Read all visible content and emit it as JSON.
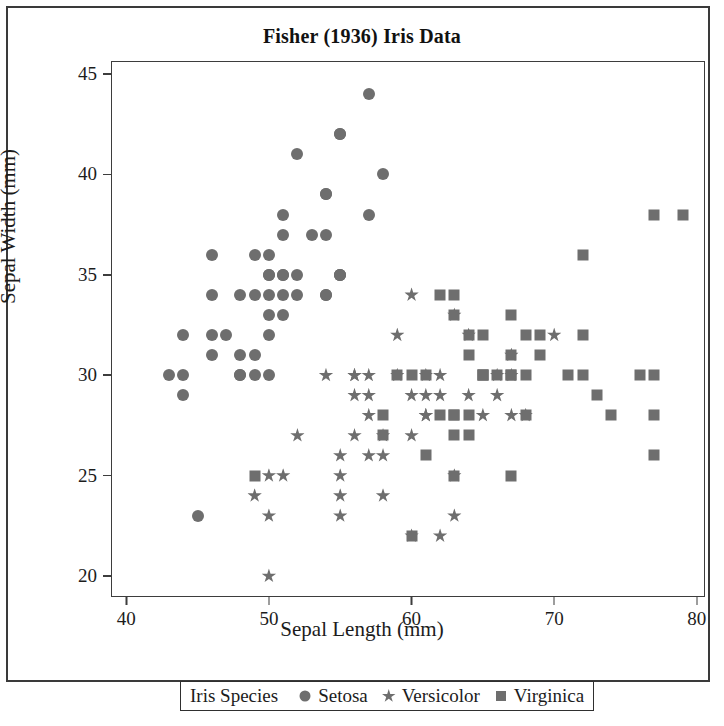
{
  "figure": {
    "title": "Fisher (1936) Iris Data"
  },
  "axes": {
    "x_title": "Sepal Length (mm)",
    "y_title": "Sepal Width (mm)"
  },
  "legend": {
    "title": "Iris Species",
    "entries": [
      {
        "label": "Setosa",
        "marker": "circle-marker-icon"
      },
      {
        "label": "Versicolor",
        "marker": "star-marker-icon"
      },
      {
        "label": "Virginica",
        "marker": "square-marker-icon"
      }
    ]
  },
  "colors": {
    "marker": "#6e6e6e",
    "axis": "#3d3d3d",
    "text": "#1c1c1c",
    "background": "#ffffff",
    "page_border": "#3a3a3a"
  },
  "chart_data": {
    "type": "scatter",
    "title": "Fisher (1936) Iris Data",
    "xlabel": "Sepal Length (mm)",
    "ylabel": "Sepal Width (mm)",
    "xlim": [
      39,
      80.5
    ],
    "ylim": [
      19,
      45.6
    ],
    "xticks": [
      40,
      50,
      60,
      70,
      80
    ],
    "yticks": [
      20,
      25,
      30,
      35,
      40,
      45
    ],
    "grid": false,
    "legend_position": "below-axes",
    "series": [
      {
        "name": "Setosa",
        "marker": "circle",
        "color": "#6e6e6e",
        "points": [
          [
            43,
            30
          ],
          [
            44,
            30
          ],
          [
            44,
            32
          ],
          [
            44,
            29
          ],
          [
            45,
            23
          ],
          [
            46,
            36
          ],
          [
            46,
            34
          ],
          [
            46,
            31
          ],
          [
            46,
            32
          ],
          [
            47,
            32
          ],
          [
            48,
            34
          ],
          [
            48,
            31
          ],
          [
            48,
            30
          ],
          [
            48,
            30
          ],
          [
            49,
            31
          ],
          [
            49,
            36
          ],
          [
            49,
            30
          ],
          [
            49,
            34
          ],
          [
            50,
            36
          ],
          [
            50,
            35
          ],
          [
            50,
            34
          ],
          [
            50,
            33
          ],
          [
            50,
            30
          ],
          [
            50,
            35
          ],
          [
            50,
            32
          ],
          [
            51,
            35
          ],
          [
            51,
            38
          ],
          [
            51,
            37
          ],
          [
            51,
            33
          ],
          [
            51,
            34
          ],
          [
            51,
            35
          ],
          [
            52,
            41
          ],
          [
            52,
            35
          ],
          [
            52,
            34
          ],
          [
            53,
            37
          ],
          [
            54,
            39
          ],
          [
            54,
            37
          ],
          [
            54,
            34
          ],
          [
            54,
            39
          ],
          [
            54,
            34
          ],
          [
            55,
            35
          ],
          [
            55,
            42
          ],
          [
            55,
            35
          ],
          [
            55,
            42
          ],
          [
            55,
            35
          ],
          [
            57,
            44
          ],
          [
            57,
            38
          ],
          [
            58,
            40
          ]
        ]
      },
      {
        "name": "Versicolor",
        "marker": "star",
        "color": "#6e6e6e",
        "points": [
          [
            49,
            24
          ],
          [
            50,
            20
          ],
          [
            50,
            23
          ],
          [
            50,
            25
          ],
          [
            51,
            25
          ],
          [
            52,
            27
          ],
          [
            55,
            23
          ],
          [
            55,
            24
          ],
          [
            55,
            26
          ],
          [
            55,
            25
          ],
          [
            56,
            30
          ],
          [
            56,
            29
          ],
          [
            56,
            30
          ],
          [
            56,
            27
          ],
          [
            57,
            26
          ],
          [
            57,
            28
          ],
          [
            57,
            29
          ],
          [
            57,
            30
          ],
          [
            58,
            26
          ],
          [
            58,
            27
          ],
          [
            58,
            24
          ],
          [
            59,
            30
          ],
          [
            59,
            32
          ],
          [
            60,
            22
          ],
          [
            60,
            29
          ],
          [
            60,
            27
          ],
          [
            60,
            34
          ],
          [
            61,
            28
          ],
          [
            61,
            30
          ],
          [
            61,
            29
          ],
          [
            61,
            28
          ],
          [
            62,
            22
          ],
          [
            62,
            29
          ],
          [
            62,
            30
          ],
          [
            63,
            25
          ],
          [
            63,
            23
          ],
          [
            63,
            33
          ],
          [
            64,
            29
          ],
          [
            64,
            32
          ],
          [
            65,
            28
          ],
          [
            66,
            30
          ],
          [
            66,
            29
          ],
          [
            67,
            31
          ],
          [
            67,
            30
          ],
          [
            67,
            28
          ],
          [
            68,
            28
          ],
          [
            70,
            32
          ],
          [
            54,
            30
          ]
        ]
      },
      {
        "name": "Virginica",
        "marker": "square",
        "color": "#6e6e6e",
        "points": [
          [
            49,
            25
          ],
          [
            58,
            28
          ],
          [
            58,
            27
          ],
          [
            59,
            30
          ],
          [
            60,
            22
          ],
          [
            60,
            30
          ],
          [
            61,
            26
          ],
          [
            61,
            30
          ],
          [
            62,
            28
          ],
          [
            62,
            34
          ],
          [
            63,
            28
          ],
          [
            63,
            27
          ],
          [
            63,
            28
          ],
          [
            63,
            34
          ],
          [
            63,
            25
          ],
          [
            63,
            33
          ],
          [
            64,
            28
          ],
          [
            64,
            31
          ],
          [
            64,
            32
          ],
          [
            64,
            27
          ],
          [
            65,
            30
          ],
          [
            65,
            30
          ],
          [
            65,
            32
          ],
          [
            65,
            30
          ],
          [
            66,
            30
          ],
          [
            67,
            33
          ],
          [
            67,
            30
          ],
          [
            67,
            31
          ],
          [
            67,
            25
          ],
          [
            67,
            30
          ],
          [
            68,
            32
          ],
          [
            68,
            28
          ],
          [
            68,
            30
          ],
          [
            69,
            31
          ],
          [
            69,
            32
          ],
          [
            71,
            30
          ],
          [
            72,
            36
          ],
          [
            72,
            32
          ],
          [
            72,
            30
          ],
          [
            73,
            29
          ],
          [
            74,
            28
          ],
          [
            76,
            30
          ],
          [
            77,
            38
          ],
          [
            77,
            26
          ],
          [
            77,
            28
          ],
          [
            77,
            30
          ],
          [
            79,
            38
          ]
        ]
      }
    ]
  }
}
